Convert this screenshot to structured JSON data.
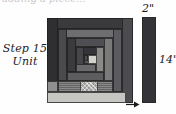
{
  "page": {
    "title": "Step 15 Unit",
    "top_partial_text": "adding a piece..."
  },
  "caption": {
    "line1": "Step 15",
    "line2": "Unit"
  },
  "dimensions": {
    "width_label": "2\"",
    "height_label": "14\"",
    "arrow_icon": "arrow-right-icon"
  },
  "colors": {
    "darkest": "#2e2e30",
    "dark": "#3c3c3f",
    "mid_dark": "#4b4b4e",
    "mid": "#5a5a5d",
    "mid_light": "#6b6b6d",
    "light": "#8b8b8c",
    "lighter": "#a5a5a4",
    "lightest": "#c9c9c6",
    "center": "#d6d6d0",
    "outline": "#1e1e1e",
    "paper": "#fefefe"
  },
  "block": {
    "name": "log-cabin-block",
    "logs": [
      {
        "id": "outer-top",
        "x": 0,
        "y": 0,
        "w": 86,
        "h": 11,
        "fill": "#3a3a3d",
        "texture": "none"
      },
      {
        "id": "outer-left",
        "x": 0,
        "y": 0,
        "w": 11,
        "h": 74,
        "fill": "#2f2f32",
        "texture": "none"
      },
      {
        "id": "outer-right",
        "x": 75,
        "y": 0,
        "w": 11,
        "h": 85,
        "fill": "#4c4c50",
        "texture": "none"
      },
      {
        "id": "outer-bottom-lt",
        "x": 0,
        "y": 63,
        "w": 11,
        "h": 11,
        "fill": "#8f8f8e",
        "texture": "none"
      },
      {
        "id": "outer-bottom",
        "x": 0,
        "y": 74,
        "w": 79,
        "h": 11,
        "fill": "#c6c6c2",
        "texture": "none"
      },
      {
        "id": "r2-top",
        "x": 11,
        "y": 11,
        "w": 64,
        "h": 9,
        "fill": "#6e6e71",
        "texture": "none"
      },
      {
        "id": "r2-left",
        "x": 11,
        "y": 11,
        "w": 9,
        "h": 52,
        "fill": "#4a4a4d",
        "texture": "none"
      },
      {
        "id": "r2-right",
        "x": 66,
        "y": 11,
        "w": 9,
        "h": 63,
        "fill": "#5c5c60",
        "texture": "none"
      },
      {
        "id": "r2-bottom",
        "x": 11,
        "y": 63,
        "w": 55,
        "h": 11,
        "fill": "#6f6f70",
        "texture": "speck"
      },
      {
        "id": "r3-top",
        "x": 20,
        "y": 20,
        "w": 46,
        "h": 9,
        "fill": "#4f4f53",
        "texture": "none"
      },
      {
        "id": "r3-left",
        "x": 20,
        "y": 20,
        "w": 9,
        "h": 34,
        "fill": "#3b3b3e",
        "texture": "none"
      },
      {
        "id": "r3-right",
        "x": 57,
        "y": 20,
        "w": 9,
        "h": 43,
        "fill": "#7a7a7b",
        "texture": "none"
      },
      {
        "id": "r3-bottom",
        "x": 20,
        "y": 54,
        "w": 37,
        "h": 9,
        "fill": "#5d5d60",
        "texture": "none"
      },
      {
        "id": "r4-top",
        "x": 29,
        "y": 29,
        "w": 28,
        "h": 8,
        "fill": "#34343a",
        "texture": "none"
      },
      {
        "id": "r4-left",
        "x": 29,
        "y": 29,
        "w": 8,
        "h": 18,
        "fill": "#464649",
        "texture": "none"
      },
      {
        "id": "r4-right",
        "x": 49,
        "y": 29,
        "w": 8,
        "h": 25,
        "fill": "#8a8a89",
        "texture": "none"
      },
      {
        "id": "r4-bottom",
        "x": 29,
        "y": 46,
        "w": 20,
        "h": 8,
        "fill": "#6a6a6c",
        "texture": "none"
      },
      {
        "id": "r5-top",
        "x": 37,
        "y": 37,
        "w": 12,
        "h": 4,
        "fill": "#3f3f43",
        "texture": "none"
      },
      {
        "id": "r5-left",
        "x": 37,
        "y": 37,
        "w": 4,
        "h": 9,
        "fill": "#4d4d50",
        "texture": "none"
      },
      {
        "id": "r5-bottom",
        "x": 37,
        "y": 42,
        "w": 12,
        "h": 4,
        "fill": "#59595c",
        "texture": "none"
      },
      {
        "id": "center-square",
        "x": 41,
        "y": 37,
        "w": 9,
        "h": 9,
        "fill": "#d2d2cb",
        "texture": "none"
      },
      {
        "id": "bottom-hatch",
        "x": 33,
        "y": 63,
        "w": 18,
        "h": 11,
        "fill": "#9a9a98",
        "texture": "hatch"
      }
    ]
  },
  "strip": {
    "name": "measure-strip",
    "fill": "#343438"
  }
}
